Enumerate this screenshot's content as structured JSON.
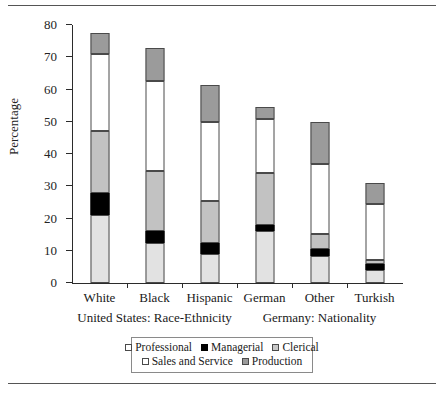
{
  "chart_data": {
    "type": "bar",
    "subtype": "stacked-bar",
    "title": "",
    "xlabel": "",
    "ylabel": "Percentage",
    "ylim": [
      0,
      80
    ],
    "yticks": [
      0,
      10,
      20,
      30,
      40,
      50,
      60,
      70,
      80
    ],
    "grid": false,
    "legend_position": "bottom",
    "categories": [
      "White",
      "Black",
      "Hispanic",
      "German",
      "Other",
      "Turkish"
    ],
    "group_labels": [
      {
        "label": "United States: Race-Ethnicity",
        "categories": [
          "White",
          "Black",
          "Hispanic"
        ]
      },
      {
        "label": "Germany: Nationality",
        "categories": [
          "German",
          "Other",
          "Turkish"
        ]
      }
    ],
    "series": [
      {
        "name": "Professional",
        "color": "#e2e2e2",
        "values": [
          21.0,
          12.5,
          9.0,
          16.0,
          8.5,
          4.0
        ]
      },
      {
        "name": "Managerial",
        "color": "#000000",
        "values": [
          7.0,
          3.5,
          3.5,
          2.0,
          2.0,
          2.0
        ]
      },
      {
        "name": "Clerical",
        "color": "#c2c2c2",
        "values": [
          19.0,
          18.8,
          13.0,
          16.0,
          4.8,
          1.0
        ]
      },
      {
        "name": "Sales and Service",
        "color": "#ffffff",
        "values": [
          24.0,
          27.7,
          24.5,
          17.0,
          21.7,
          17.5
        ]
      },
      {
        "name": "Production",
        "color": "#9b9b9b",
        "values": [
          6.5,
          10.5,
          11.5,
          3.5,
          13.0,
          6.5
        ]
      }
    ],
    "totals": [
      77.5,
      73.0,
      61.5,
      54.5,
      50.0,
      31.0
    ]
  },
  "legend": {
    "row1": [
      {
        "label": "Professional",
        "swatch": "professional"
      },
      {
        "label": "Managerial",
        "swatch": "managerial"
      },
      {
        "label": "Clerical",
        "swatch": "clerical"
      }
    ],
    "row2": [
      {
        "label": "Sales and Service",
        "swatch": "sales"
      },
      {
        "label": "Production",
        "swatch": "production"
      }
    ]
  }
}
